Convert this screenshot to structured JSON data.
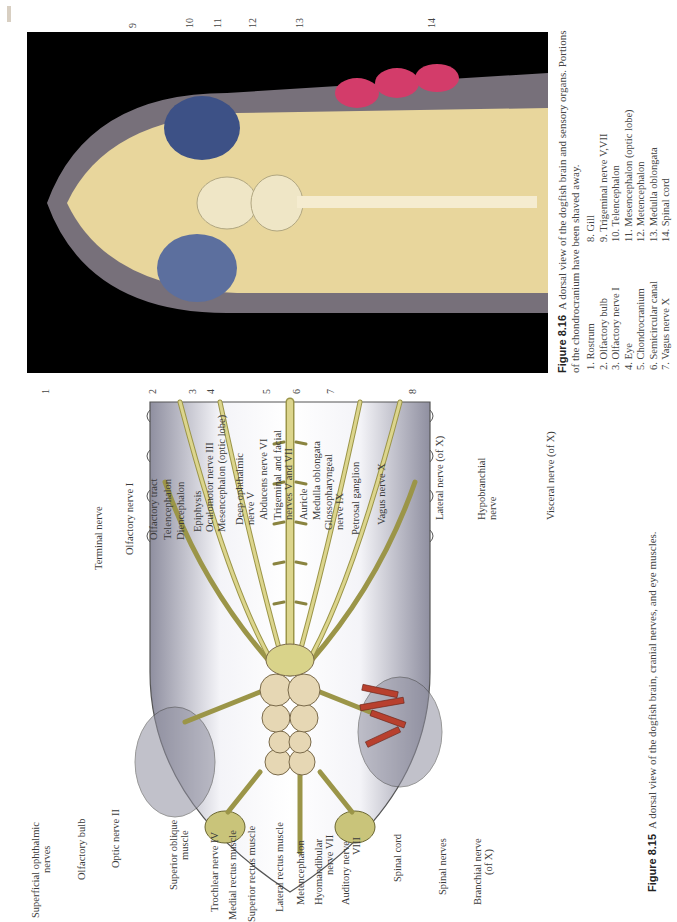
{
  "figure_8_15": {
    "caption_label": "Figure 8.15",
    "caption_text": "A dorsal view of the dogfish brain, cranial nerves, and eye muscles.",
    "labels_top": [
      {
        "text": "Terminal nerve"
      },
      {
        "text": "Olfactory nerve I"
      },
      {
        "text": "Olfactory tract"
      },
      {
        "text": "Telencephalon"
      },
      {
        "text": "Diencephalon"
      },
      {
        "text": "Epiphysis"
      },
      {
        "text": "Oculomotor nerve III"
      },
      {
        "text": "Mesencephalon (optic lobe)"
      },
      {
        "text": "Deep ophthalmic",
        "text2": "nerve V"
      },
      {
        "text": "Abducens nerve VI"
      },
      {
        "text": "Trigeminal and facial",
        "text2": "nerves V and VII"
      },
      {
        "text": "Auricle"
      },
      {
        "text": "Medulla oblongata"
      },
      {
        "text": "Glossopharyngeal",
        "text2": "nerve IX"
      },
      {
        "text": "Petrosal ganglion"
      },
      {
        "text": "Vagus nerve X"
      },
      {
        "text": "Lateral nerve (of X)"
      },
      {
        "text": "Hypobranchial",
        "text2": "nerve"
      },
      {
        "text": "Visceral nerve (of X)"
      }
    ],
    "labels_bottom": [
      {
        "text": "Superficial ophthalmic",
        "text2": "nerves"
      },
      {
        "text": "Olfactory bulb"
      },
      {
        "text": "Optic nerve II"
      },
      {
        "text": "Superior oblique",
        "text2": "muscle"
      },
      {
        "text": "Trochlear nerve IV"
      },
      {
        "text": "Medial rectus muscle"
      },
      {
        "text": "Superior rectus muscle"
      },
      {
        "text": "Lateral rectus muscle"
      },
      {
        "text": "Metencephalon"
      },
      {
        "text": "Hyomandibular",
        "text2": "nerve VII"
      },
      {
        "text": "Auditory nerve",
        "text2": "VIII"
      },
      {
        "text": "Spinal cord"
      },
      {
        "text": "Spinal nerves"
      },
      {
        "text": "Branchial nerve",
        "text2": "(of X)"
      }
    ]
  },
  "figure_8_16": {
    "caption_label": "Figure 8.16",
    "caption_text": "A dorsal view of the dogfish brain and sensory organs. Portions of the chondrocranium have been shaved away.",
    "callout_numbers_bottom": [
      "1",
      "2",
      "3",
      "4",
      "5",
      "6",
      "7",
      "8"
    ],
    "callout_numbers_top": [
      "9",
      "10",
      "11",
      "12",
      "13",
      "14"
    ],
    "legend_col1": [
      "1. Rostrum",
      "2. Olfactory bulb",
      "3. Olfactory nerve I",
      "4. Eye",
      "5. Chondrocranium",
      "6. Semicircular canal",
      "7. Vagus nerve X"
    ],
    "legend_col2": [
      "8. Gill",
      "9. Trigeminal nerve V,VII",
      "10. Telencephalon",
      "11. Mesencephalon (optic lobe)",
      "12. Metencephalon",
      "13. Medulla oblongata",
      "14. Spinal cord"
    ]
  },
  "colors": {
    "nerve": "#d9d38a",
    "nerve_outline": "#8a8440",
    "brain": "#e6d7b4",
    "body_gray": "#9a9aa8",
    "muscle": "#b8402e",
    "photo_bg": "#000000"
  }
}
